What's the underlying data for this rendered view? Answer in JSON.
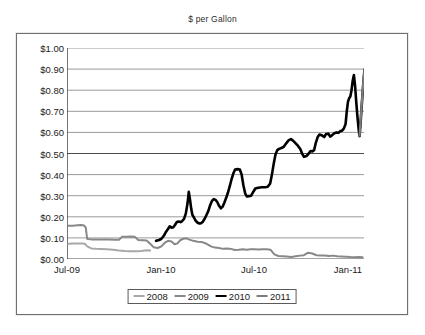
{
  "chart_data": {
    "type": "line",
    "title": "$ per Gallon",
    "xlabel": "",
    "ylabel": "",
    "ylim": [
      0,
      1.0
    ],
    "ytick_values": [
      0.0,
      0.1,
      0.2,
      0.3,
      0.4,
      0.5,
      0.6,
      0.7,
      0.8,
      0.9,
      1.0
    ],
    "ytick_labels": [
      "$0.00",
      "$0.10",
      "$0.20",
      "$0.30",
      "$0.40",
      "$0.50",
      "$0.60",
      "$0.70",
      "$0.80",
      "$0.90",
      "$1.00"
    ],
    "xtick_labels": [
      "Jul-09",
      "Jan-10",
      "Jul-10",
      "Jan-11"
    ],
    "xtick_positions": [
      0.0,
      0.3165,
      0.6296,
      0.9461
    ],
    "grid": "horizontal",
    "legend_position": "bottom-center",
    "series": [
      {
        "name": "2008",
        "color": "#a8a8a8",
        "width": 2.0,
        "points": [
          [
            0.005,
            0.072
          ],
          [
            0.02,
            0.074
          ],
          [
            0.035,
            0.074
          ],
          [
            0.05,
            0.073
          ],
          [
            0.06,
            0.072
          ],
          [
            0.068,
            0.06
          ],
          [
            0.082,
            0.05
          ],
          [
            0.098,
            0.048
          ],
          [
            0.115,
            0.047
          ],
          [
            0.135,
            0.046
          ],
          [
            0.155,
            0.044
          ],
          [
            0.175,
            0.04
          ],
          [
            0.195,
            0.038
          ],
          [
            0.215,
            0.037
          ],
          [
            0.235,
            0.037
          ],
          [
            0.25,
            0.038
          ],
          [
            0.262,
            0.04
          ],
          [
            0.272,
            0.041
          ],
          [
            0.28,
            0.04
          ]
        ]
      },
      {
        "name": "2009",
        "color": "#888888",
        "width": 2.0,
        "points": [
          [
            0.005,
            0.157
          ],
          [
            0.02,
            0.158
          ],
          [
            0.035,
            0.16
          ],
          [
            0.048,
            0.161
          ],
          [
            0.057,
            0.159
          ],
          [
            0.063,
            0.15
          ],
          [
            0.068,
            0.095
          ],
          [
            0.082,
            0.093
          ],
          [
            0.1,
            0.092
          ],
          [
            0.12,
            0.092
          ],
          [
            0.14,
            0.092
          ],
          [
            0.16,
            0.091
          ],
          [
            0.175,
            0.091
          ],
          [
            0.185,
            0.105
          ],
          [
            0.2,
            0.106
          ],
          [
            0.215,
            0.107
          ],
          [
            0.228,
            0.106
          ],
          [
            0.24,
            0.09
          ],
          [
            0.255,
            0.089
          ],
          [
            0.268,
            0.088
          ],
          [
            0.28,
            0.072
          ],
          [
            0.292,
            0.056
          ],
          [
            0.305,
            0.052
          ],
          [
            0.318,
            0.06
          ],
          [
            0.33,
            0.078
          ],
          [
            0.34,
            0.086
          ],
          [
            0.352,
            0.083
          ],
          [
            0.362,
            0.07
          ],
          [
            0.372,
            0.074
          ],
          [
            0.382,
            0.09
          ],
          [
            0.392,
            0.096
          ],
          [
            0.402,
            0.098
          ],
          [
            0.412,
            0.092
          ],
          [
            0.425,
            0.086
          ],
          [
            0.44,
            0.082
          ],
          [
            0.455,
            0.08
          ],
          [
            0.47,
            0.072
          ],
          [
            0.485,
            0.06
          ],
          [
            0.498,
            0.054
          ],
          [
            0.512,
            0.052
          ],
          [
            0.525,
            0.048
          ],
          [
            0.54,
            0.05
          ],
          [
            0.552,
            0.048
          ],
          [
            0.565,
            0.043
          ],
          [
            0.578,
            0.044
          ],
          [
            0.592,
            0.046
          ],
          [
            0.605,
            0.044
          ],
          [
            0.618,
            0.046
          ],
          [
            0.632,
            0.046
          ],
          [
            0.645,
            0.045
          ],
          [
            0.658,
            0.046
          ],
          [
            0.672,
            0.046
          ],
          [
            0.685,
            0.044
          ],
          [
            0.698,
            0.022
          ],
          [
            0.712,
            0.014
          ],
          [
            0.726,
            0.013
          ],
          [
            0.74,
            0.012
          ],
          [
            0.755,
            0.01
          ],
          [
            0.77,
            0.013
          ],
          [
            0.785,
            0.016
          ],
          [
            0.798,
            0.018
          ],
          [
            0.812,
            0.03
          ],
          [
            0.826,
            0.026
          ],
          [
            0.84,
            0.018
          ],
          [
            0.855,
            0.016
          ],
          [
            0.868,
            0.017
          ],
          [
            0.882,
            0.014
          ],
          [
            0.896,
            0.016
          ],
          [
            0.91,
            0.013
          ],
          [
            0.925,
            0.012
          ],
          [
            0.94,
            0.011
          ],
          [
            0.955,
            0.009
          ],
          [
            0.968,
            0.008
          ],
          [
            0.982,
            0.01
          ],
          [
            0.995,
            0.008
          ]
        ]
      },
      {
        "name": "2010",
        "color": "#000000",
        "width": 2.6,
        "points": [
          [
            0.3,
            0.086
          ],
          [
            0.31,
            0.09
          ],
          [
            0.318,
            0.096
          ],
          [
            0.326,
            0.11
          ],
          [
            0.333,
            0.128
          ],
          [
            0.34,
            0.142
          ],
          [
            0.346,
            0.155
          ],
          [
            0.352,
            0.148
          ],
          [
            0.358,
            0.15
          ],
          [
            0.364,
            0.162
          ],
          [
            0.37,
            0.175
          ],
          [
            0.376,
            0.178
          ],
          [
            0.382,
            0.175
          ],
          [
            0.388,
            0.18
          ],
          [
            0.394,
            0.19
          ],
          [
            0.4,
            0.215
          ],
          [
            0.406,
            0.265
          ],
          [
            0.41,
            0.318
          ],
          [
            0.414,
            0.283
          ],
          [
            0.418,
            0.24
          ],
          [
            0.422,
            0.21
          ],
          [
            0.428,
            0.195
          ],
          [
            0.434,
            0.18
          ],
          [
            0.44,
            0.172
          ],
          [
            0.446,
            0.168
          ],
          [
            0.452,
            0.17
          ],
          [
            0.458,
            0.178
          ],
          [
            0.464,
            0.192
          ],
          [
            0.47,
            0.21
          ],
          [
            0.476,
            0.228
          ],
          [
            0.482,
            0.255
          ],
          [
            0.488,
            0.275
          ],
          [
            0.494,
            0.284
          ],
          [
            0.5,
            0.28
          ],
          [
            0.506,
            0.27
          ],
          [
            0.512,
            0.252
          ],
          [
            0.518,
            0.24
          ],
          [
            0.524,
            0.248
          ],
          [
            0.53,
            0.268
          ],
          [
            0.536,
            0.29
          ],
          [
            0.542,
            0.315
          ],
          [
            0.548,
            0.345
          ],
          [
            0.554,
            0.378
          ],
          [
            0.56,
            0.405
          ],
          [
            0.566,
            0.424
          ],
          [
            0.574,
            0.426
          ],
          [
            0.582,
            0.424
          ],
          [
            0.588,
            0.4
          ],
          [
            0.594,
            0.348
          ],
          [
            0.6,
            0.31
          ],
          [
            0.606,
            0.296
          ],
          [
            0.612,
            0.298
          ],
          [
            0.62,
            0.3
          ],
          [
            0.628,
            0.32
          ],
          [
            0.634,
            0.334
          ],
          [
            0.644,
            0.338
          ],
          [
            0.656,
            0.34
          ],
          [
            0.668,
            0.34
          ],
          [
            0.676,
            0.342
          ],
          [
            0.684,
            0.358
          ],
          [
            0.69,
            0.4
          ],
          [
            0.696,
            0.452
          ],
          [
            0.702,
            0.495
          ],
          [
            0.708,
            0.516
          ],
          [
            0.714,
            0.522
          ],
          [
            0.722,
            0.526
          ],
          [
            0.73,
            0.532
          ],
          [
            0.738,
            0.548
          ],
          [
            0.746,
            0.562
          ],
          [
            0.754,
            0.568
          ],
          [
            0.762,
            0.56
          ],
          [
            0.77,
            0.548
          ],
          [
            0.778,
            0.536
          ],
          [
            0.786,
            0.52
          ],
          [
            0.792,
            0.498
          ],
          [
            0.798,
            0.484
          ],
          [
            0.806,
            0.488
          ],
          [
            0.814,
            0.5
          ],
          [
            0.82,
            0.512
          ],
          [
            0.826,
            0.51
          ],
          [
            0.832,
            0.516
          ],
          [
            0.838,
            0.552
          ],
          [
            0.844,
            0.578
          ],
          [
            0.85,
            0.59
          ],
          [
            0.858,
            0.586
          ],
          [
            0.866,
            0.578
          ],
          [
            0.872,
            0.592
          ],
          [
            0.88,
            0.594
          ],
          [
            0.886,
            0.58
          ],
          [
            0.892,
            0.586
          ],
          [
            0.9,
            0.596
          ],
          [
            0.908,
            0.6
          ],
          [
            0.914,
            0.598
          ],
          [
            0.92,
            0.606
          ],
          [
            0.926,
            0.608
          ],
          [
            0.932,
            0.618
          ],
          [
            0.938,
            0.64
          ],
          [
            0.942,
            0.7
          ],
          [
            0.946,
            0.745
          ],
          [
            0.95,
            0.762
          ],
          [
            0.954,
            0.77
          ],
          [
            0.958,
            0.8
          ],
          [
            0.962,
            0.845
          ],
          [
            0.966,
            0.872
          ],
          [
            0.97,
            0.82
          ],
          [
            0.974,
            0.742
          ],
          [
            0.978,
            0.672
          ],
          [
            0.982,
            0.615
          ],
          [
            0.985,
            0.582
          ],
          [
            0.988,
            0.636
          ],
          [
            0.991,
            0.7
          ],
          [
            0.994,
            0.762
          ],
          [
            0.997,
            0.82
          ],
          [
            1.0,
            0.872
          ],
          [
            1.002,
            0.898
          ]
        ]
      },
      {
        "name": "2011",
        "color": "#7d7d7d",
        "width": 2.2,
        "points": [
          [
            0.985,
            0.585
          ],
          [
            0.988,
            0.645
          ],
          [
            0.991,
            0.706
          ],
          [
            0.994,
            0.768
          ],
          [
            0.997,
            0.826
          ],
          [
            1.0,
            0.874
          ],
          [
            1.002,
            0.9
          ]
        ]
      }
    ]
  },
  "legend": {
    "entries": [
      {
        "label": "2008"
      },
      {
        "label": "2009"
      },
      {
        "label": "2010"
      },
      {
        "label": "2011"
      }
    ]
  }
}
